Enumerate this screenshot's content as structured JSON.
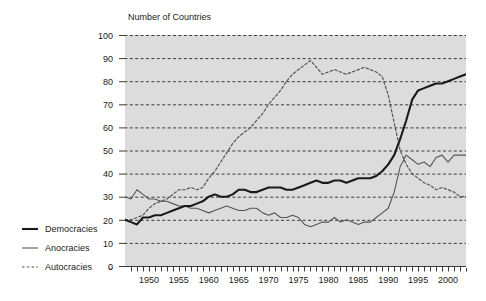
{
  "chart_data": {
    "type": "line",
    "title": "Number of Countries",
    "xlabel": "",
    "ylabel": "",
    "ylim": [
      0,
      100
    ],
    "xlim": [
      1946,
      2003
    ],
    "ytick_step": 10,
    "yticks": [
      "0",
      "10",
      "20",
      "30",
      "40",
      "50",
      "60",
      "70",
      "80",
      "90",
      "100"
    ],
    "xticks": [
      "1950",
      "1955",
      "1960",
      "1965",
      "1970",
      "1975",
      "1980",
      "1985",
      "1990",
      "1995",
      "2000"
    ],
    "grid": "horizontal-dashed",
    "legend_position": "left-outside",
    "plot_background": "#dcdcdc",
    "x": [
      1946,
      1947,
      1948,
      1949,
      1950,
      1951,
      1952,
      1953,
      1954,
      1955,
      1956,
      1957,
      1958,
      1959,
      1960,
      1961,
      1962,
      1963,
      1964,
      1965,
      1966,
      1967,
      1968,
      1969,
      1970,
      1971,
      1972,
      1973,
      1974,
      1975,
      1976,
      1977,
      1978,
      1979,
      1980,
      1981,
      1982,
      1983,
      1984,
      1985,
      1986,
      1987,
      1988,
      1989,
      1990,
      1991,
      1992,
      1993,
      1994,
      1995,
      1996,
      1997,
      1998,
      1999,
      2000,
      2001,
      2002,
      2003
    ],
    "series": [
      {
        "name": "Democracies",
        "style": "solid-thick",
        "color": "#1a1a1a",
        "values": [
          20,
          19,
          18,
          21,
          21,
          22,
          22,
          23,
          24,
          25,
          26,
          26,
          27,
          28,
          30,
          31,
          30,
          30,
          31,
          33,
          33,
          32,
          32,
          33,
          34,
          34,
          34,
          33,
          33,
          34,
          35,
          36,
          37,
          36,
          36,
          37,
          37,
          36,
          37,
          38,
          38,
          38,
          39,
          41,
          44,
          48,
          55,
          63,
          72,
          76,
          77,
          78,
          79,
          79,
          80,
          81,
          82,
          83
        ]
      },
      {
        "name": "Anocracies",
        "style": "solid-thin",
        "color": "#555555",
        "values": [
          30,
          29,
          33,
          31,
          29,
          29,
          28,
          28,
          27,
          26,
          26,
          25,
          25,
          24,
          23,
          24,
          25,
          26,
          25,
          24,
          24,
          25,
          25,
          23,
          22,
          23,
          21,
          21,
          22,
          21,
          18,
          17,
          18,
          19,
          19,
          21,
          19,
          20,
          19,
          18,
          19,
          19,
          21,
          23,
          25,
          32,
          43,
          48,
          46,
          44,
          45,
          43,
          47,
          48,
          45,
          48,
          48,
          48
        ]
      },
      {
        "name": "Autocracies",
        "style": "dashed",
        "color": "#555555",
        "values": [
          20,
          20,
          21,
          22,
          25,
          27,
          28,
          29,
          31,
          33,
          33,
          34,
          33,
          34,
          38,
          41,
          45,
          49,
          53,
          56,
          58,
          60,
          63,
          66,
          70,
          73,
          76,
          80,
          83,
          85,
          87,
          89,
          86,
          83,
          84,
          85,
          84,
          83,
          84,
          85,
          86,
          85,
          84,
          82,
          74,
          62,
          50,
          44,
          40,
          38,
          36,
          35,
          33,
          34,
          33,
          32,
          30,
          30
        ]
      }
    ],
    "legend": [
      {
        "label": "Democracies",
        "style": "solid-thick"
      },
      {
        "label": "Anocracies",
        "style": "solid-thin"
      },
      {
        "label": "Autocracies",
        "style": "dashed"
      }
    ]
  }
}
